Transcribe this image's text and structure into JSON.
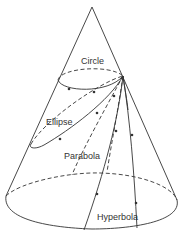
{
  "diagram": {
    "labels": {
      "circle": "Circle",
      "ellipse": "Ellipse",
      "parabola": "Parabola",
      "hyperbola": "Hyperbola"
    },
    "colors": {
      "stroke": "#333333",
      "background": "#ffffff"
    }
  }
}
